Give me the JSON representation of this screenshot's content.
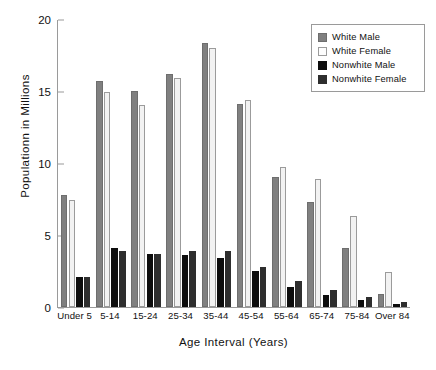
{
  "chart_data": {
    "type": "bar",
    "title": "",
    "xlabel": "Age Interval  (Years)",
    "ylabel": "Populationn in Millions",
    "ylim": [
      0,
      20
    ],
    "yticks": [
      0,
      5,
      10,
      15,
      20
    ],
    "ytick_labels": [
      "0",
      "5",
      "10",
      "15",
      "20"
    ],
    "grid": false,
    "legend_position": "top-right",
    "categories": [
      "Under 5",
      "5-14",
      "15-24",
      "25-34",
      "35-44",
      "45-54",
      "55-64",
      "65-74",
      "75-84",
      "Over 84"
    ],
    "series": [
      {
        "name": "White Male",
        "color": "#808080",
        "values": [
          7.8,
          15.7,
          15.0,
          16.2,
          18.3,
          14.1,
          9.0,
          7.3,
          4.1,
          0.9
        ]
      },
      {
        "name": "White Female",
        "color": "#f2f2f2",
        "values": [
          7.4,
          14.9,
          14.0,
          15.9,
          18.0,
          14.4,
          9.7,
          8.9,
          6.3,
          2.4
        ]
      },
      {
        "name": "Nonwhite Male",
        "color": "#0d0d0d",
        "values": [
          2.1,
          4.1,
          3.7,
          3.6,
          3.4,
          2.5,
          1.4,
          0.8,
          0.5,
          0.2
        ]
      },
      {
        "name": "Nonwhite Female",
        "color": "#2e2e2e",
        "values": [
          2.1,
          3.9,
          3.7,
          3.9,
          3.9,
          2.8,
          1.8,
          1.2,
          0.7,
          0.35
        ]
      }
    ]
  }
}
